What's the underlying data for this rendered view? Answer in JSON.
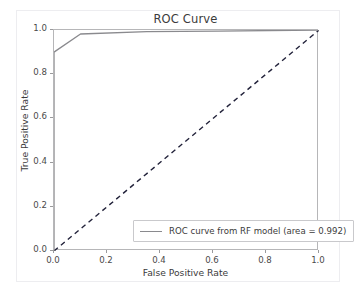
{
  "chart_data": {
    "type": "line",
    "title": "ROC Curve",
    "xlabel": "False Positive Rate",
    "ylabel": "True Positive Rate",
    "xlim": [
      0.0,
      1.0
    ],
    "ylim": [
      0.0,
      1.0
    ],
    "grid": false,
    "legend_position": "lower right",
    "xticks": [
      "0.0",
      "0.2",
      "0.4",
      "0.6",
      "0.8",
      "1.0"
    ],
    "xtick_values": [
      0.0,
      0.2,
      0.4,
      0.6,
      0.8,
      1.0
    ],
    "yticks": [
      "0.0",
      "0.2",
      "0.4",
      "0.6",
      "0.8",
      "1.0"
    ],
    "ytick_values": [
      0.0,
      0.2,
      0.4,
      0.6,
      0.8,
      1.0
    ],
    "series": [
      {
        "name": "ROC curve from RF model (area = 0.992)",
        "color": "#8a8a8e",
        "linestyle": "solid",
        "x": [
          0.0,
          0.0,
          0.1,
          0.35,
          0.62,
          1.0
        ],
        "y": [
          0.0,
          0.9,
          0.982,
          0.993,
          0.995,
          1.0
        ]
      },
      {
        "name": "chance-reference",
        "color": "#22223a",
        "linestyle": "dashed",
        "x": [
          0.0,
          1.0
        ],
        "y": [
          0.0,
          1.0
        ]
      }
    ],
    "legend": [
      {
        "label": "ROC curve from RF model (area = 0.992)",
        "color": "#8a8a8e",
        "area": 0.992,
        "model": "RF model"
      }
    ],
    "annotations": []
  },
  "figure": {
    "background": "#ffffff",
    "spine_color": "#b6b6b8",
    "text_color": "#3b3b3b"
  }
}
